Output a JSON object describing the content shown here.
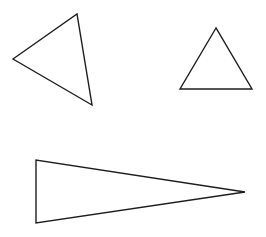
{
  "canvas": {
    "width": 266,
    "height": 237,
    "background": "#ffffff",
    "stroke": "#1e1e1e"
  },
  "shapes": [
    {
      "name": "scalene-triangle-tilted",
      "points": "13,59 77,14 92,105"
    },
    {
      "name": "equilateral-triangle",
      "points": "216,28 180,89 252,89"
    },
    {
      "name": "long-isosceles-triangle",
      "points": "36,160 36,223 245,192"
    }
  ]
}
